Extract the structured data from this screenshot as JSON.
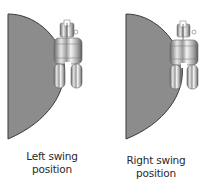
{
  "figure": {
    "panels": [
      {
        "id": "left",
        "caption_line1": "Left swing",
        "caption_line2": "position"
      },
      {
        "id": "right",
        "caption_line1": "Right swing",
        "caption_line2": "position"
      }
    ],
    "colors": {
      "shape_fill": "#8c8c8c",
      "shape_edge": "#3a3a3a",
      "metal_light": "#f2f2f2",
      "metal_mid": "#b5b5b5",
      "metal_dark": "#5a5a5a",
      "text": "#2a2a2a",
      "background": "#ffffff"
    }
  }
}
